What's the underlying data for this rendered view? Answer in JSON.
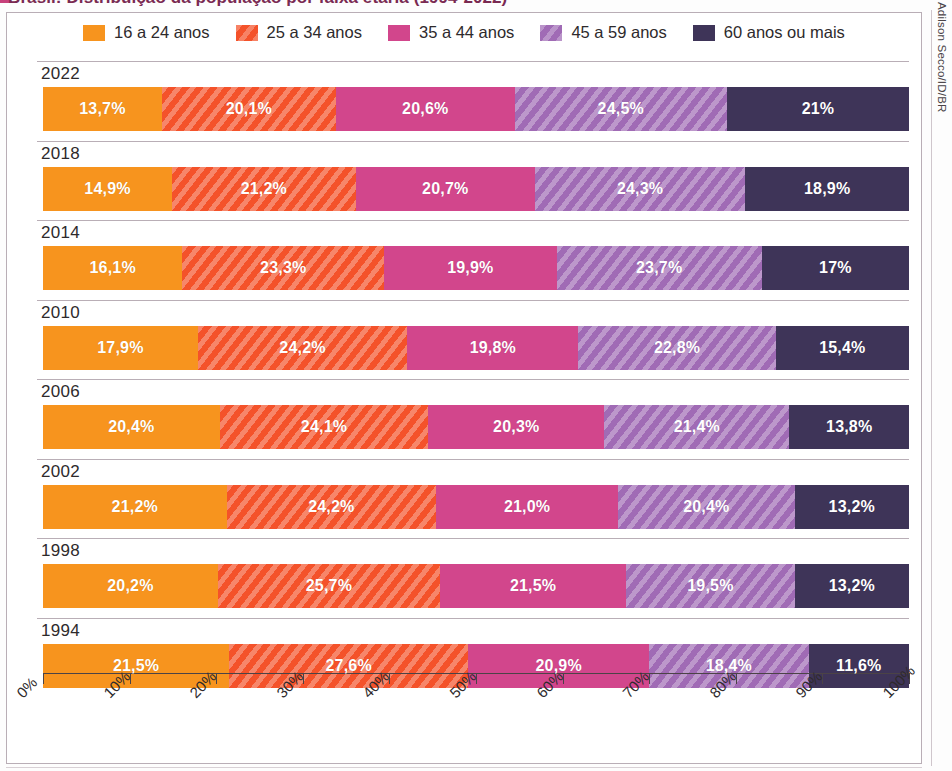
{
  "figure": {
    "title_partial": "Brasil: Distribuição da população por faixa etária (1994-2022)",
    "credit": "Adilson Secco/ID/BR"
  },
  "legend": {
    "items": [
      {
        "label": "16 a 24 anos",
        "color": "#F7941E",
        "hatched": false
      },
      {
        "label": "25 a 34 anos",
        "color": "#F4522A",
        "hatched": true
      },
      {
        "label": "35 a 44 anos",
        "color": "#D2468C",
        "hatched": false
      },
      {
        "label": "45 a 59 anos",
        "color": "#A06BB5",
        "hatched": true
      },
      {
        "label": "60 anos ou mais",
        "color": "#3E3458",
        "hatched": false
      }
    ]
  },
  "axis": {
    "ticks": [
      "0%",
      "10%",
      "20%",
      "30%",
      "40%",
      "50%",
      "60%",
      "70%",
      "80%",
      "90%",
      "100%"
    ],
    "min": 0,
    "max": 100
  },
  "chart_data": {
    "type": "bar",
    "orientation": "horizontal",
    "stacked": true,
    "normalized_percent": true,
    "title": "Brasil: Distribuição da população por faixa etária (1994-2022)",
    "xlabel": "",
    "ylabel": "",
    "xlim": [
      0,
      100
    ],
    "grid": false,
    "legend_position": "top-center",
    "categories": [
      "2022",
      "2018",
      "2014",
      "2010",
      "2006",
      "2002",
      "1998",
      "1994"
    ],
    "series": [
      {
        "name": "16 a 24 anos",
        "color": "#F7941E",
        "values": [
          13.7,
          14.9,
          16.1,
          17.9,
          20.4,
          21.2,
          20.2,
          21.5
        ],
        "labels": [
          "13,7%",
          "14,9%",
          "16,1%",
          "17,9%",
          "20,4%",
          "21,2%",
          "20,2%",
          "21,5%"
        ]
      },
      {
        "name": "25 a 34 anos",
        "color": "#F4522A",
        "values": [
          20.1,
          21.2,
          23.3,
          24.2,
          24.1,
          24.2,
          25.7,
          27.6
        ],
        "labels": [
          "20,1%",
          "21,2%",
          "23,3%",
          "24,2%",
          "24,1%",
          "24,2%",
          "25,7%",
          "27,6%"
        ]
      },
      {
        "name": "35 a 44 anos",
        "color": "#D2468C",
        "values": [
          20.6,
          20.7,
          19.9,
          19.8,
          20.3,
          21.0,
          21.5,
          20.9
        ],
        "labels": [
          "20,6%",
          "20,7%",
          "19,9%",
          "19,8%",
          "20,3%",
          "21,0%",
          "21,5%",
          "20,9%"
        ]
      },
      {
        "name": "45 a 59 anos",
        "color": "#A06BB5",
        "values": [
          24.5,
          24.3,
          23.7,
          22.8,
          21.4,
          20.4,
          19.5,
          18.4
        ],
        "labels": [
          "24,5%",
          "24,3%",
          "23,7%",
          "22,8%",
          "21,4%",
          "20,4%",
          "19,5%",
          "18,4%"
        ]
      },
      {
        "name": "60 anos ou mais",
        "color": "#3E3458",
        "values": [
          21.0,
          18.9,
          17.0,
          15.4,
          13.8,
          13.2,
          13.2,
          11.6
        ],
        "labels": [
          "21%",
          "18,9%",
          "17%",
          "15,4%",
          "13,8%",
          "13,2%",
          "13,2%",
          "11,6%"
        ]
      }
    ]
  }
}
